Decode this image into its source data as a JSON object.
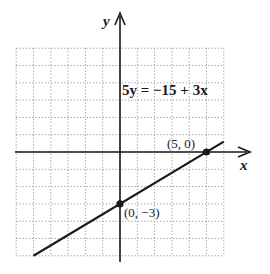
{
  "figure": {
    "equation": "5y = −15 + 3x",
    "x_axis_label": "x",
    "y_axis_label": "y",
    "points": [
      {
        "label": "(5, 0)",
        "x": 5,
        "y": 0
      },
      {
        "label": "(0, −3)",
        "x": 0,
        "y": -3
      }
    ],
    "grid": {
      "xmin": -6,
      "xmax": 6,
      "ymin": -6,
      "ymax": 6,
      "step": 1,
      "style": "dotted"
    },
    "line": {
      "slope": 0.6,
      "intercept": -3,
      "from": {
        "x": -5,
        "y": -6
      },
      "to": {
        "x": 6,
        "y": 0.6
      }
    },
    "colors": {
      "ink": "#1a1a1a",
      "grid": "#9a9a9a",
      "background": "#ffffff"
    }
  }
}
